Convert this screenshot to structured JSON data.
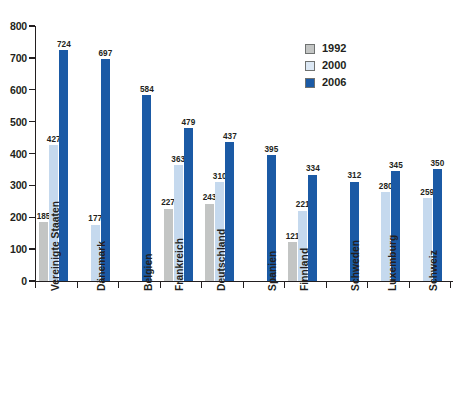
{
  "chart_data": {
    "type": "bar",
    "title": "",
    "subtitle": "",
    "xlabel": "",
    "ylabel": "",
    "ylim": [
      0,
      800
    ],
    "yticks": [
      0,
      100,
      200,
      300,
      400,
      500,
      600,
      700,
      800
    ],
    "ytick_labels": [
      "0",
      "100",
      "200",
      "300",
      "400",
      "500",
      "600",
      "700",
      "800"
    ],
    "grid": false,
    "legend_position": "top-right",
    "categories": [
      "Vereinigte Staaten",
      "Dänemark",
      "Belgien",
      "Frankreich",
      "Deutschland",
      "Spanien",
      "Finnland",
      "Schweden",
      "Luxemburg",
      "Schweiz"
    ],
    "series": [
      {
        "name": "1992",
        "color": "#c3c5c4",
        "values": [
          185,
          null,
          null,
          227,
          243,
          null,
          121,
          null,
          null,
          null
        ]
      },
      {
        "name": "2000",
        "color": "#c5d9ee",
        "values": [
          427,
          177,
          null,
          363,
          310,
          null,
          221,
          null,
          280,
          259
        ]
      },
      {
        "name": "2006",
        "color": "#1b5aa5",
        "values": [
          724,
          697,
          584,
          479,
          437,
          395,
          334,
          312,
          345,
          350
        ]
      }
    ]
  },
  "legend": {
    "items": [
      {
        "label": "1992",
        "swatch": "legend-swatch-1992"
      },
      {
        "label": "2000",
        "swatch": "legend-swatch-2000"
      },
      {
        "label": "2006",
        "swatch": "legend-swatch-2006"
      }
    ]
  },
  "colors": {
    "series_1992": "#c3c5c4",
    "series_2000": "#c5d9ee",
    "series_2006": "#1b5aa5",
    "axis": "#231f20",
    "background": "#ffffff"
  }
}
